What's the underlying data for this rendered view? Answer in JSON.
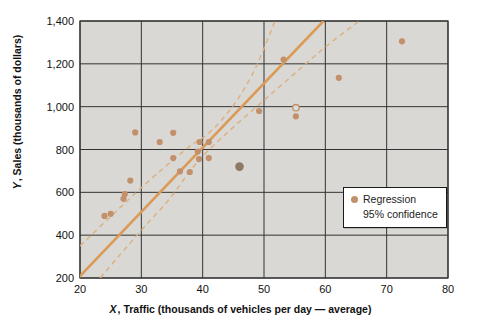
{
  "figure": {
    "y_axis": {
      "var": "Y",
      "rest": ", Sales (thousands of dollars)"
    },
    "x_axis": {
      "var": "X",
      "rest": ", Traffic (thousands of vehicles per day — average)"
    },
    "legend": {
      "regression": "Regression",
      "confidence": "95% confidence"
    }
  },
  "chart_data": {
    "type": "scatter",
    "title": "",
    "xlabel": "X, Traffic (thousands of vehicles per day — average)",
    "ylabel": "Y, Sales (thousands of dollars)",
    "xlim": [
      20,
      80
    ],
    "ylim": [
      200,
      1400
    ],
    "grid": true,
    "legend_position": "lower right",
    "x_ticks": [
      {
        "v": 20,
        "label": "20"
      },
      {
        "v": 30,
        "label": "30"
      },
      {
        "v": 40,
        "label": "40"
      },
      {
        "v": 50,
        "label": "50"
      },
      {
        "v": 60,
        "label": "60"
      },
      {
        "v": 70,
        "label": "70"
      },
      {
        "v": 80,
        "label": "80"
      }
    ],
    "y_ticks": [
      {
        "v": 200,
        "label": "200"
      },
      {
        "v": 400,
        "label": "400"
      },
      {
        "v": 600,
        "label": "600"
      },
      {
        "v": 800,
        "label": "800"
      },
      {
        "v": 1000,
        "label": "1,000"
      },
      {
        "v": 1200,
        "label": "1,200"
      },
      {
        "v": 1400,
        "label": "1,400"
      }
    ],
    "points": [
      {
        "x": 24,
        "y": 490
      },
      {
        "x": 25,
        "y": 500
      },
      {
        "x": 27.1,
        "y": 570
      },
      {
        "x": 27.3,
        "y": 592
      },
      {
        "x": 28.2,
        "y": 655
      },
      {
        "x": 29,
        "y": 880
      },
      {
        "x": 33,
        "y": 835
      },
      {
        "x": 35.2,
        "y": 878
      },
      {
        "x": 35.2,
        "y": 760
      },
      {
        "x": 36.3,
        "y": 698
      },
      {
        "x": 37.9,
        "y": 695
      },
      {
        "x": 39.2,
        "y": 790
      },
      {
        "x": 39.4,
        "y": 755
      },
      {
        "x": 39.5,
        "y": 835
      },
      {
        "x": 41,
        "y": 835
      },
      {
        "x": 41,
        "y": 760
      },
      {
        "x": 46,
        "y": 720,
        "style": "emphasis"
      },
      {
        "x": 49.2,
        "y": 980
      },
      {
        "x": 53.2,
        "y": 1220
      },
      {
        "x": 55.2,
        "y": 995,
        "style": "open"
      },
      {
        "x": 55.2,
        "y": 955
      },
      {
        "x": 62.2,
        "y": 1135
      },
      {
        "x": 72.5,
        "y": 1305
      }
    ],
    "regression_line": {
      "x1": 19.7,
      "y1": 200,
      "x2": 59.7,
      "y2": 1400
    },
    "confidence_band_upper": [
      [
        20,
        350
      ],
      [
        26,
        515
      ],
      [
        32,
        675
      ],
      [
        38,
        820
      ],
      [
        41,
        870
      ],
      [
        45,
        1000
      ],
      [
        48,
        1140
      ],
      [
        50,
        1270
      ],
      [
        51.8,
        1400
      ]
    ],
    "confidence_band_lower": [
      [
        23.3,
        200
      ],
      [
        27,
        325
      ],
      [
        31,
        455
      ],
      [
        35,
        580
      ],
      [
        38,
        705
      ],
      [
        41,
        800
      ],
      [
        45,
        905
      ],
      [
        50,
        1030
      ],
      [
        55,
        1155
      ],
      [
        60,
        1280
      ],
      [
        65.5,
        1400
      ]
    ],
    "colors": {
      "plot_background": "#d9d8d4",
      "grid": "#333333",
      "regression_line": "#db9a56",
      "confidence_band": "#ddb07e",
      "point": "#c2906a",
      "point_emphasis": "#8d7a66",
      "point_open_fill": "#dcdbd8",
      "text": "#111111"
    }
  }
}
